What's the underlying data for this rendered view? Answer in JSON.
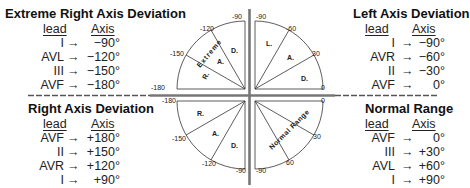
{
  "panels": {
    "top_left": {
      "title": "Extreme Right Axis Deviation",
      "col_lead": "lead",
      "col_axis": "Axis",
      "rows": [
        {
          "lead": "I",
          "arrow": "→",
          "axis": "−90°"
        },
        {
          "lead": "AVL",
          "arrow": "→",
          "axis": "−120°"
        },
        {
          "lead": "III",
          "arrow": "→",
          "axis": "−150°"
        },
        {
          "lead": "AVF",
          "arrow": "→",
          "axis": "−180°"
        }
      ]
    },
    "top_right": {
      "title": "Left Axis Deviation",
      "col_lead": "lead",
      "col_axis": "Axis",
      "rows": [
        {
          "lead": "I",
          "arrow": "→",
          "axis": "−90°"
        },
        {
          "lead": "AVR",
          "arrow": "→",
          "axis": "−60°"
        },
        {
          "lead": "II",
          "arrow": "→",
          "axis": "−30°"
        },
        {
          "lead": "AVF",
          "arrow": "→",
          "axis": "0°"
        }
      ]
    },
    "bottom_left": {
      "title": "Right Axis Deviation",
      "col_lead": "lead",
      "col_axis": "Axis",
      "rows": [
        {
          "lead": "AVF",
          "arrow": "→",
          "axis": "+180°"
        },
        {
          "lead": "II",
          "arrow": "→",
          "axis": "+150°"
        },
        {
          "lead": "AVR",
          "arrow": "→",
          "axis": "+120°"
        },
        {
          "lead": "I",
          "arrow": "→",
          "axis": "+90°"
        }
      ]
    },
    "bottom_right": {
      "title": "Normal Range",
      "col_lead": "lead",
      "col_axis": "Axis",
      "rows": [
        {
          "lead": "AVF",
          "arrow": "→",
          "axis": "0°"
        },
        {
          "lead": "III",
          "arrow": "→",
          "axis": "+30°"
        },
        {
          "lead": "AVL",
          "arrow": "→",
          "axis": "+60°"
        },
        {
          "lead": "I",
          "arrow": "→",
          "axis": "+90°"
        }
      ]
    }
  },
  "diagram": {
    "top_left": {
      "labels": {
        "a180": "-180",
        "a150": "-150",
        "a120": "-120",
        "a90": "-90"
      },
      "sectors": {
        "r": "R.",
        "a": "A.",
        "d": "D.",
        "extreme": "Extreme"
      }
    },
    "top_right": {
      "labels": {
        "a90": "-90",
        "a60": "-60",
        "a30": "30",
        "a0": "0"
      },
      "sectors": {
        "l": "L.",
        "a": "A.",
        "d": "D."
      }
    },
    "bottom_left": {
      "labels": {
        "a180": "-180",
        "a150": "-150",
        "a120": "-120",
        "a90": "-90"
      },
      "sectors": {
        "r": "R.",
        "a": "A.",
        "d": "D."
      }
    },
    "bottom_right": {
      "labels": {
        "a0": "0",
        "a30": "30",
        "a60": "60",
        "a90": "-90"
      },
      "sectors": {
        "normal": "Normal Range"
      }
    }
  }
}
